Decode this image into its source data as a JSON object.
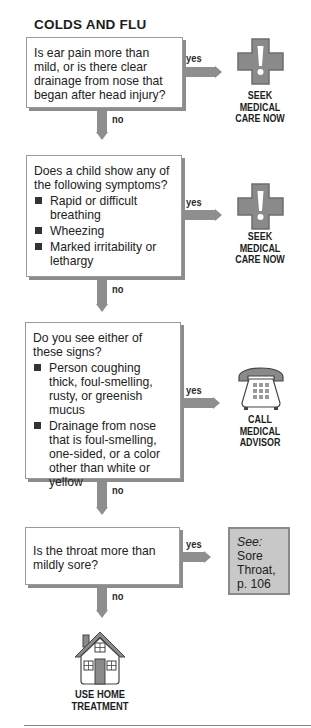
{
  "title": "COLDS AND FLU",
  "labels": {
    "yes": "yes",
    "no": "no"
  },
  "steps": [
    {
      "question": "Is ear pain more than mild, or is there clear drainage from nose that began after head injury?",
      "bullets": [],
      "yes_outcome": {
        "icon": "medical-cross-icon",
        "lines": [
          "SEEK",
          "MEDICAL",
          "CARE NOW"
        ]
      }
    },
    {
      "question": "Does a child show any of the following symptoms?",
      "bullets": [
        "Rapid or difficult breathing",
        "Wheezing",
        "Marked irritability or lethargy"
      ],
      "yes_outcome": {
        "icon": "medical-cross-icon",
        "lines": [
          "SEEK",
          "MEDICAL",
          "CARE NOW"
        ]
      }
    },
    {
      "question": "Do you see either of these signs?",
      "bullets": [
        "Person coughing thick, foul-smelling, rusty, or greenish mucus",
        "Drainage from nose that is foul-smelling, one-sided, or a color other than white or yellow"
      ],
      "yes_outcome": {
        "icon": "telephone-icon",
        "lines": [
          "CALL",
          "MEDICAL",
          "ADVISOR"
        ]
      }
    },
    {
      "question": "Is the throat more than mildly sore?",
      "bullets": [],
      "yes_outcome": {
        "icon": "see-reference",
        "see": "See:",
        "ref_lines": [
          "Sore",
          "Throat,",
          "p. 106"
        ]
      }
    }
  ],
  "final_outcome": {
    "icon": "house-icon",
    "lines": [
      "USE HOME",
      "TREATMENT"
    ]
  },
  "colors": {
    "arrow": "#8e8e8e",
    "icon_fill": "#8a8a8a",
    "see_box": "#c8c8c8",
    "text": "#222222"
  }
}
